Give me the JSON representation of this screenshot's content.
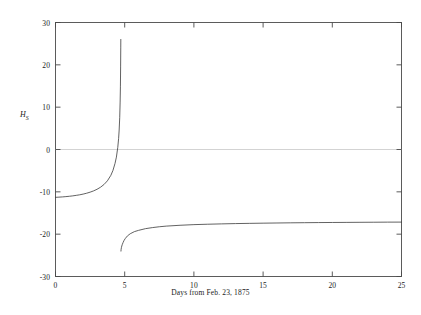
{
  "chart_data": {
    "type": "line",
    "title": "",
    "xlabel": "Days from Feb. 23, 1875",
    "ylabel": "H_S",
    "ylabel_base": "H",
    "ylabel_sub": "S",
    "xlim": [
      0,
      25
    ],
    "ylim": [
      -30,
      30
    ],
    "xticks": [
      0,
      5,
      10,
      15,
      20,
      25
    ],
    "yticks": [
      -30,
      -20,
      -10,
      0,
      10,
      20,
      30
    ],
    "xtick_labels": [
      "0",
      "5",
      "10",
      "15",
      "20",
      "25"
    ],
    "ytick_labels": [
      "-30",
      "-20",
      "-10",
      "0",
      "10",
      "20",
      "30"
    ],
    "grid": false,
    "legend": false,
    "zero_line": 0,
    "asymptote_x": 4.72,
    "line_color": "#3a3a3a",
    "zero_line_color": "#b8b8b8",
    "frame_color": "#4a4a4a",
    "series": [
      {
        "name": "branch-left",
        "x": [
          0.0,
          0.25,
          0.5,
          0.75,
          1.0,
          1.25,
          1.5,
          1.75,
          2.0,
          2.25,
          2.5,
          2.75,
          3.0,
          3.25,
          3.5,
          3.75,
          4.0,
          4.15,
          4.3,
          4.4,
          4.5,
          4.56,
          4.6,
          4.64,
          4.67,
          4.69,
          4.705,
          4.715,
          4.72
        ],
        "y": [
          -11.3,
          -11.25,
          -11.2,
          -11.13,
          -11.05,
          -10.95,
          -10.83,
          -10.7,
          -10.53,
          -10.33,
          -10.08,
          -9.78,
          -9.4,
          -8.92,
          -8.28,
          -7.4,
          -6.1,
          -4.95,
          -3.3,
          -1.8,
          0.5,
          2.6,
          4.6,
          7.6,
          11.2,
          14.8,
          19.5,
          24.0,
          26.0
        ]
      },
      {
        "name": "branch-right",
        "x": [
          4.73,
          4.74,
          4.76,
          4.79,
          4.83,
          4.88,
          4.95,
          5.05,
          5.2,
          5.4,
          5.7,
          6.0,
          6.5,
          7.0,
          7.5,
          8.0,
          9.0,
          10.0,
          11.0,
          12.0,
          13.0,
          14.0,
          15.0,
          16.0,
          17.0,
          18.0,
          19.0,
          20.0,
          21.0,
          22.0,
          23.0,
          24.0,
          25.0
        ],
        "y": [
          -24.0,
          -23.6,
          -23.2,
          -22.8,
          -22.4,
          -22.0,
          -21.5,
          -21.0,
          -20.4,
          -19.9,
          -19.4,
          -19.1,
          -18.7,
          -18.45,
          -18.25,
          -18.1,
          -17.9,
          -17.75,
          -17.65,
          -17.57,
          -17.5,
          -17.45,
          -17.4,
          -17.36,
          -17.32,
          -17.29,
          -17.26,
          -17.24,
          -17.22,
          -17.2,
          -17.18,
          -17.16,
          -17.15
        ]
      }
    ]
  },
  "axes": {
    "xlabel": "Days from Feb. 23, 1875",
    "ylabel_base": "H",
    "ylabel_sub": "S",
    "xtick_labels": [
      "0",
      "5",
      "10",
      "15",
      "20",
      "25"
    ],
    "ytick_labels": [
      "30",
      "20",
      "10",
      "0",
      "-10",
      "-20",
      "-30"
    ]
  }
}
